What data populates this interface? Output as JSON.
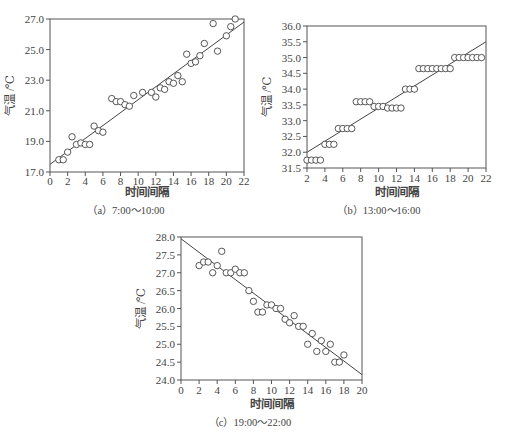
{
  "chart_data": [
    {
      "id": "a",
      "type": "scatter",
      "caption": "（a）7:00～10:00",
      "xlabel": "时间间隔",
      "ylabel": "气温 /℃",
      "xlim": [
        0,
        22
      ],
      "ylim": [
        17.0,
        27.0
      ],
      "xticks": [
        0,
        2,
        4,
        6,
        8,
        10,
        12,
        14,
        16,
        18,
        20,
        22
      ],
      "yticks": [
        17.0,
        19.0,
        21.0,
        23.0,
        25.0,
        27.0
      ],
      "ytick_labels": [
        "17.0",
        "19.0",
        "21.0",
        "23.0",
        "25.0",
        "27.0"
      ],
      "grid": false,
      "points": [
        [
          1,
          17.8
        ],
        [
          1.5,
          17.8
        ],
        [
          2,
          18.3
        ],
        [
          2.5,
          19.3
        ],
        [
          3,
          18.8
        ],
        [
          3.5,
          18.9
        ],
        [
          4,
          18.8
        ],
        [
          4.5,
          18.8
        ],
        [
          5,
          20.0
        ],
        [
          5.5,
          19.7
        ],
        [
          6,
          19.6
        ],
        [
          7,
          21.8
        ],
        [
          7.5,
          21.6
        ],
        [
          8,
          21.6
        ],
        [
          8.5,
          21.4
        ],
        [
          9,
          21.3
        ],
        [
          9.5,
          22.0
        ],
        [
          10.5,
          22.2
        ],
        [
          11.5,
          22.2
        ],
        [
          12,
          21.9
        ],
        [
          12.5,
          22.5
        ],
        [
          13,
          22.4
        ],
        [
          13.5,
          22.9
        ],
        [
          14,
          22.8
        ],
        [
          14.5,
          23.3
        ],
        [
          15,
          22.9
        ],
        [
          15.5,
          24.7
        ],
        [
          16,
          24.1
        ],
        [
          16.5,
          24.2
        ],
        [
          17,
          24.6
        ],
        [
          17.5,
          25.4
        ],
        [
          18.5,
          26.7
        ],
        [
          19,
          24.9
        ],
        [
          20,
          25.9
        ],
        [
          20.5,
          26.5
        ],
        [
          21,
          27.0
        ]
      ],
      "fit_line": [
        [
          0,
          17.5
        ],
        [
          22,
          26.8
        ]
      ]
    },
    {
      "id": "b",
      "type": "scatter",
      "caption": "（b）13:00～16:00",
      "xlabel": "时间间隔",
      "ylabel": "气温 /℃",
      "xlim": [
        2,
        22
      ],
      "ylim": [
        31.5,
        36.0
      ],
      "xticks": [
        2,
        4,
        6,
        8,
        10,
        12,
        14,
        16,
        18,
        20,
        22
      ],
      "yticks": [
        31.5,
        32.0,
        32.5,
        33.0,
        33.5,
        34.0,
        34.5,
        35.0,
        35.5,
        36.0
      ],
      "ytick_labels": [
        "31.5",
        "32.0",
        "32.5",
        "33.0",
        "33.5",
        "34.0",
        "34.5",
        "35.0",
        "35.5",
        "36.0"
      ],
      "grid": false,
      "points": [
        [
          2,
          31.75
        ],
        [
          2.5,
          31.75
        ],
        [
          3,
          31.75
        ],
        [
          3.5,
          31.75
        ],
        [
          4,
          32.25
        ],
        [
          4.5,
          32.25
        ],
        [
          5,
          32.25
        ],
        [
          5.5,
          32.75
        ],
        [
          6,
          32.75
        ],
        [
          6.5,
          32.75
        ],
        [
          7,
          32.75
        ],
        [
          7.5,
          33.6
        ],
        [
          8,
          33.6
        ],
        [
          8.5,
          33.6
        ],
        [
          9,
          33.6
        ],
        [
          9.5,
          33.45
        ],
        [
          10,
          33.45
        ],
        [
          10.5,
          33.45
        ],
        [
          11,
          33.4
        ],
        [
          11.5,
          33.4
        ],
        [
          12,
          33.4
        ],
        [
          12.5,
          33.4
        ],
        [
          13,
          34.0
        ],
        [
          13.5,
          34.0
        ],
        [
          14,
          34.0
        ],
        [
          14.5,
          34.65
        ],
        [
          15,
          34.65
        ],
        [
          15.5,
          34.65
        ],
        [
          16,
          34.65
        ],
        [
          16.5,
          34.65
        ],
        [
          17,
          34.65
        ],
        [
          17.5,
          34.65
        ],
        [
          18,
          34.65
        ],
        [
          18.5,
          35.0
        ],
        [
          19,
          35.0
        ],
        [
          19.5,
          35.0
        ],
        [
          20,
          35.0
        ],
        [
          20.5,
          35.0
        ],
        [
          21,
          35.0
        ],
        [
          21.5,
          35.0
        ]
      ],
      "fit_line": [
        [
          2,
          32.0
        ],
        [
          22,
          35.5
        ]
      ]
    },
    {
      "id": "c",
      "type": "scatter",
      "caption": "（c）19:00～22:00",
      "xlabel": "时间间隔",
      "ylabel": "气温 /℃",
      "xlim": [
        0,
        20
      ],
      "ylim": [
        24.0,
        28.0
      ],
      "xticks": [
        0,
        2,
        4,
        6,
        8,
        10,
        12,
        14,
        16,
        18,
        20
      ],
      "yticks": [
        24.0,
        24.5,
        25.0,
        25.5,
        26.0,
        26.5,
        27.0,
        27.5,
        28.0
      ],
      "ytick_labels": [
        "24.0",
        "24.5",
        "25.0",
        "25.5",
        "26.0",
        "26.5",
        "27.0",
        "27.5",
        "28.0"
      ],
      "grid": false,
      "points": [
        [
          2,
          27.2
        ],
        [
          2.5,
          27.3
        ],
        [
          3,
          27.3
        ],
        [
          3.5,
          27.0
        ],
        [
          4,
          27.2
        ],
        [
          4.5,
          27.6
        ],
        [
          5,
          27.0
        ],
        [
          5.5,
          27.0
        ],
        [
          6,
          27.1
        ],
        [
          6.5,
          27.0
        ],
        [
          7,
          27.0
        ],
        [
          7.5,
          26.5
        ],
        [
          8,
          26.2
        ],
        [
          8.5,
          25.9
        ],
        [
          9,
          25.9
        ],
        [
          9.5,
          26.1
        ],
        [
          10,
          26.1
        ],
        [
          10.5,
          26.0
        ],
        [
          11,
          26.0
        ],
        [
          11.5,
          25.7
        ],
        [
          12,
          25.6
        ],
        [
          12.5,
          25.8
        ],
        [
          13,
          25.5
        ],
        [
          13.5,
          25.5
        ],
        [
          14,
          25.0
        ],
        [
          14.5,
          25.3
        ],
        [
          15,
          24.8
        ],
        [
          15.5,
          25.1
        ],
        [
          16,
          24.8
        ],
        [
          16.5,
          25.0
        ],
        [
          17,
          24.5
        ],
        [
          17.5,
          24.5
        ],
        [
          18,
          24.7
        ]
      ],
      "fit_line": [
        [
          0,
          27.95
        ],
        [
          20,
          24.15
        ]
      ]
    }
  ]
}
